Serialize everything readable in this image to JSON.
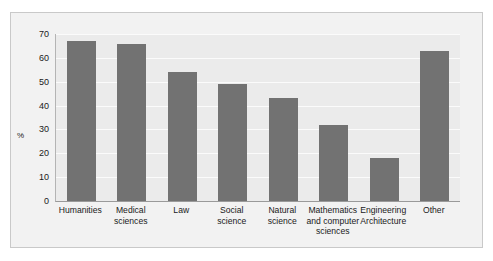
{
  "chart_data": {
    "type": "bar",
    "title": "",
    "subtitle": "",
    "xlabel": "",
    "ylabel": "%",
    "ylim": [
      0,
      70
    ],
    "yticks": [
      0,
      10,
      20,
      30,
      40,
      50,
      60,
      70
    ],
    "grid": true,
    "legend": false,
    "orientation": "vertical",
    "bar_color": "#727272",
    "plot_background": "#ebebeb",
    "figure_background": "#f2f2f2",
    "categories": [
      "Humanities",
      "Medical sciences",
      "Law",
      "Social science",
      "Natural science",
      "Mathematics and computer sciences",
      "Engineering Architecture",
      "Other"
    ],
    "category_lines": [
      [
        "Humanities"
      ],
      [
        "Medical",
        "sciences"
      ],
      [
        "Law"
      ],
      [
        "Social",
        "science"
      ],
      [
        "Natural",
        "science"
      ],
      [
        "Mathematics",
        "and computer",
        "sciences"
      ],
      [
        "Engineering",
        "Architecture"
      ],
      [
        "Other"
      ]
    ],
    "values": [
      67,
      66,
      54,
      49,
      43,
      32,
      18,
      63
    ],
    "series": [
      {
        "name": "%",
        "values": [
          67,
          66,
          54,
          49,
          43,
          32,
          18,
          63
        ]
      }
    ]
  }
}
